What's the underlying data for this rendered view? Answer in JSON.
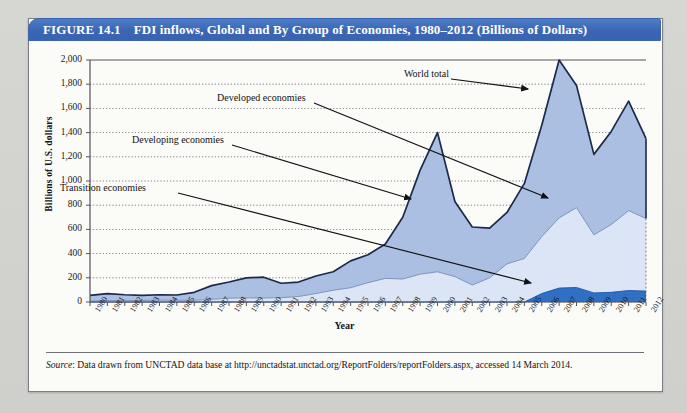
{
  "figure": {
    "number": "FIGURE 14.1",
    "title": "FDI inflows, Global and By Group of Economies, 1980–2012 (Billions of Dollars)"
  },
  "source": {
    "label": "Source",
    "text": ": Data drawn from UNCTAD data base at http://unctadstat.unctad.org/ReportFolders/reportFolders.aspx, accessed 14 March 2014."
  },
  "colors": {
    "title_bar": "#3a63b0",
    "world_total_band": "#aabfe2",
    "developing_band": "#dbe5f5",
    "transition_band": "#2f6fc4",
    "line": "#1b2a4a",
    "grid": "#3a3a40",
    "frame": "#7b7f86",
    "paper": "#fbfbf8"
  },
  "annotations": [
    {
      "name": "world-total",
      "label": "World total"
    },
    {
      "name": "developed",
      "label": "Developed economies"
    },
    {
      "name": "developing",
      "label": "Developing economies"
    },
    {
      "name": "transition",
      "label": "Transition economies"
    }
  ],
  "chart_data": {
    "type": "area",
    "title": "FDI inflows, Global and By Group of Economies, 1980–2012 (Billions of Dollars)",
    "xlabel": "Year",
    "ylabel": "Billions of U.S. dollars",
    "ylim": [
      0,
      2000
    ],
    "ytick_step": 200,
    "ytick_labels": [
      "0",
      "200",
      "400",
      "600",
      "800",
      "1,000",
      "1,200",
      "1,400",
      "1,600",
      "1,800",
      "2,000"
    ],
    "grid": true,
    "grid_style": "dotted-horizontal",
    "legend": "none (direct annotations with leader arrows)",
    "stacking": "Transition at bottom, Developing above it, Developed on top; upper envelope = World total",
    "categories": [
      "1980",
      "1981",
      "1982",
      "1983",
      "1984",
      "1985",
      "1986",
      "1987",
      "1988",
      "1989",
      "1990",
      "1991",
      "1992",
      "1993",
      "1994",
      "1995",
      "1996",
      "1997",
      "1998",
      "1999",
      "2000",
      "2001",
      "2002",
      "2003",
      "2004",
      "2005",
      "2006",
      "2007",
      "2008",
      "2009",
      "2010",
      "2011",
      "2012"
    ],
    "series": [
      {
        "name": "World total",
        "values": [
          55,
          70,
          60,
          55,
          60,
          58,
          80,
          135,
          165,
          200,
          205,
          155,
          165,
          215,
          250,
          340,
          390,
          480,
          700,
          1090,
          1400,
          830,
          620,
          610,
          740,
          980,
          1460,
          2000,
          1790,
          1220,
          1410,
          1660,
          1350
        ]
      },
      {
        "name": "Developed economies",
        "values": [
          47,
          58,
          49,
          42,
          45,
          44,
          66,
          113,
          134,
          166,
          172,
          119,
          120,
          145,
          153,
          222,
          230,
          285,
          510,
          860,
          1150,
          620,
          480,
          410,
          425,
          620,
          990,
          1420,
          1030,
          690,
          770,
          910,
          650
        ]
      },
      {
        "name": "Developing economies",
        "values": [
          8,
          12,
          11,
          13,
          15,
          14,
          14,
          22,
          31,
          34,
          33,
          36,
          45,
          70,
          97,
          118,
          160,
          195,
          190,
          230,
          250,
          210,
          140,
          200,
          315,
          360,
          470,
          580,
          660,
          480,
          560,
          660,
          600
        ]
      },
      {
        "name": "Transition economies",
        "values": [
          0,
          0,
          0,
          0,
          0,
          0,
          0,
          0,
          0,
          0,
          0,
          0,
          0,
          0,
          0,
          0,
          0,
          0,
          0,
          0,
          0,
          0,
          0,
          0,
          0,
          0,
          70,
          115,
          120,
          75,
          80,
          95,
          90
        ]
      }
    ]
  }
}
